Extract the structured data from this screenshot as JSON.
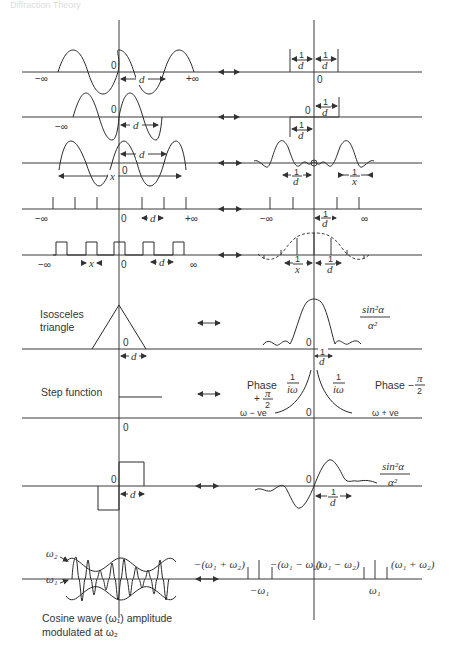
{
  "header": {
    "text": "Diffraction Theory"
  },
  "symbols": {
    "zero": "0",
    "neg_inf": "−∞",
    "pos_inf": "+∞",
    "inf": "∞",
    "d": "d",
    "x": "x",
    "one": "1",
    "pair_arrow": "⟷"
  },
  "rows": [
    {
      "id": "cosine-infinite",
      "left_labels": [
        "−∞",
        "0",
        "d",
        "+∞"
      ],
      "right_labels": [
        "1/d",
        "1/d",
        "0"
      ]
    },
    {
      "id": "cosine-half",
      "left_labels": [
        "−∞",
        "0",
        "d"
      ],
      "right_labels": [
        "0",
        "1/d",
        "1/d"
      ]
    },
    {
      "id": "cosine-finite",
      "left_labels": [
        "d",
        "x",
        "0"
      ],
      "right_labels": [
        "1/d",
        "1/x"
      ]
    },
    {
      "id": "comb",
      "left_labels": [
        "−∞",
        "0",
        "d",
        "+∞"
      ],
      "right_labels": [
        "−∞",
        "1/d",
        "∞"
      ]
    },
    {
      "id": "square-train",
      "left_labels": [
        "−∞",
        "x",
        "0",
        "d",
        "∞"
      ],
      "right_labels": [
        "1/x",
        "1/d"
      ]
    },
    {
      "id": "triangle",
      "left_labels": [
        "Isosceles",
        "triangle",
        "0",
        "d"
      ],
      "right_labels": [
        "0",
        "1/d",
        "sin²α",
        "α²"
      ]
    },
    {
      "id": "step",
      "left_labels": [
        "Step function",
        "0"
      ],
      "right_labels": [
        "Phase",
        "1/iω",
        "+π/2",
        "ω − ve",
        "0",
        "1/iω",
        "Phase − π/2",
        "ω + ve"
      ]
    },
    {
      "id": "odd-rect",
      "left_labels": [
        "0",
        "d"
      ],
      "right_labels": [
        "0",
        "1/d",
        "sin²α",
        "α²"
      ]
    },
    {
      "id": "am-cosine",
      "left_labels": [
        "ω2",
        "ω1",
        "Cosine wave (ω1) amplitude",
        "modulated at ω2"
      ],
      "right_labels": [
        "−(ω1 + ω2)",
        "−(ω1 − ω2)",
        "(ω1 − ω2)",
        "(ω1 + ω2)",
        "−ω1",
        "ω1"
      ]
    }
  ],
  "text": {
    "isosceles": "Isosceles",
    "triangle": "triangle",
    "step_function": "Step function",
    "phase": "Phase",
    "one_over_iw": "iω",
    "plus_pi2": "+",
    "pi": "π",
    "two": "2",
    "w_minus_ve": "ω − ve",
    "w_plus_ve": "ω + ve",
    "phase_minus": "Phase −",
    "sin2a": "sin²α",
    "a2": "α²",
    "w2": "ω₂",
    "w1": "ω₁",
    "caption1": "Cosine wave (ω₁) amplitude",
    "caption2": "modulated at ω₂",
    "m_w1_p_w2": "−(ω₁ + ω₂)",
    "m_w1_m_w2": "−(ω₁ − ω₂)",
    "w1_m_w2": "(ω₁ − ω₂)",
    "w1_p_w2": "(ω₁ + ω₂)",
    "m_w1": "−ω₁",
    "p_w1": "ω₁"
  }
}
